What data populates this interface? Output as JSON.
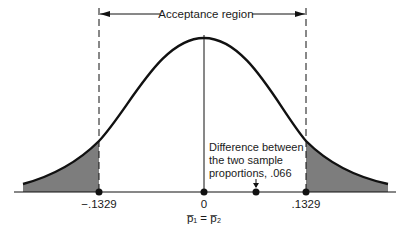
{
  "diagram": {
    "type": "normal-distribution-hypothesis-test",
    "acceptance_region_label": "Acceptance region",
    "axis_ticks": [
      {
        "label": "−.1329",
        "value": -0.1329
      },
      {
        "label": "0",
        "value": 0
      },
      {
        "label": ".1329",
        "value": 0.1329
      }
    ],
    "center_sublabel": "p̅₁ = p̅₂",
    "annotation": {
      "lines": [
        "Difference between",
        "the two sample",
        "proportions, .066"
      ],
      "value": 0.066
    },
    "colors": {
      "curve": "#111111",
      "shaded_tail": "#7d7d7d",
      "background": "#ffffff"
    }
  }
}
